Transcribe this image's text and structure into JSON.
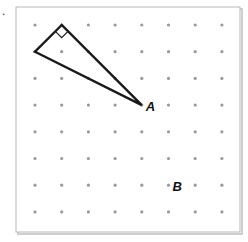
{
  "problem_marker": ".",
  "grid": {
    "columns": 8,
    "rows": 8,
    "dot_color": "#9a9a9a"
  },
  "frame": {
    "border_color": "#b9b9b9",
    "shadow_color": "#c8c8c8"
  },
  "triangle": {
    "vertices": [
      {
        "name": "right-angle-vertex",
        "col": 1,
        "row": 0
      },
      {
        "name": "left-vertex",
        "col": 0,
        "row": 1
      },
      {
        "name": "vertex-a",
        "col": 4,
        "row": 3
      }
    ],
    "right_angle_at": "right-angle-vertex",
    "stroke_color": "#1a1a1a"
  },
  "labels": [
    {
      "name": "label-a",
      "text": "A",
      "col": 4,
      "row": 3
    },
    {
      "name": "label-b",
      "text": "B",
      "col": 5,
      "row": 6
    }
  ]
}
